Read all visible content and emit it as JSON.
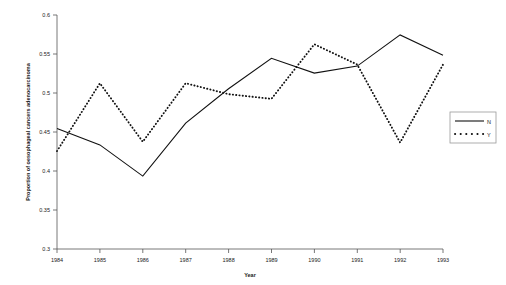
{
  "chart_data": {
    "type": "line",
    "title": "",
    "xlabel": "Year",
    "ylabel": "Proportion of oesophageal cancers adenocarcinoma",
    "x": [
      1984,
      1985,
      1986,
      1987,
      1988,
      1989,
      1990,
      1991,
      1992,
      1993
    ],
    "xticklabels": [
      "1984",
      "1985",
      "1986",
      "1987",
      "1988",
      "1989",
      "1990",
      "1991",
      "1992",
      "1993"
    ],
    "yticklabels": [
      "0.3",
      "0.35",
      "0.4",
      "0.45",
      "0.5",
      "0.55",
      "0.6"
    ],
    "yticks": [
      0.3,
      0.35,
      0.4,
      0.45,
      0.5,
      0.55,
      0.6
    ],
    "ylim": [
      0.3,
      0.6
    ],
    "xlim": [
      1984,
      1993
    ],
    "grid": false,
    "legend_position": "right",
    "series": [
      {
        "name": "N",
        "style": "solid",
        "color": "#111111",
        "values": [
          0.4545,
          0.4335,
          0.3935,
          0.4615,
          0.5055,
          0.5445,
          0.5255,
          0.5345,
          0.5745,
          0.5485
        ]
      },
      {
        "name": "Y",
        "style": "dotted",
        "color": "#111111",
        "values": [
          0.4255,
          0.5125,
          0.4375,
          0.5125,
          0.4985,
          0.4925,
          0.5625,
          0.5365,
          0.4365,
          0.5365
        ]
      }
    ]
  },
  "legend": {
    "entries": [
      {
        "label": "N",
        "style": "solid"
      },
      {
        "label": "Y",
        "style": "dotted"
      }
    ]
  }
}
